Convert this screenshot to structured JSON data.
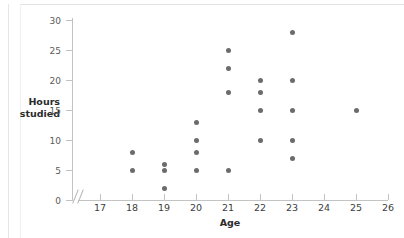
{
  "chart_data": {
    "type": "scatter",
    "title": "",
    "xlabel": "Age",
    "ylabel": "Hours studied",
    "xlim": [
      17,
      26
    ],
    "ylim": [
      0,
      30
    ],
    "xticks": [
      17,
      18,
      19,
      20,
      21,
      22,
      23,
      24,
      25,
      26
    ],
    "yticks": [
      0,
      5,
      10,
      15,
      20,
      25,
      30
    ],
    "grid": false,
    "legend": null,
    "axis_break_x": true,
    "marker_color": "#6b6b6b",
    "axis_color": "#c3c3c3",
    "points": [
      {
        "x": 18,
        "y": 8
      },
      {
        "x": 18,
        "y": 5
      },
      {
        "x": 19,
        "y": 6
      },
      {
        "x": 19,
        "y": 5
      },
      {
        "x": 19,
        "y": 2
      },
      {
        "x": 20,
        "y": 13
      },
      {
        "x": 20,
        "y": 10
      },
      {
        "x": 20,
        "y": 8
      },
      {
        "x": 20,
        "y": 5
      },
      {
        "x": 21,
        "y": 25
      },
      {
        "x": 21,
        "y": 22
      },
      {
        "x": 21,
        "y": 18
      },
      {
        "x": 21,
        "y": 5
      },
      {
        "x": 22,
        "y": 20
      },
      {
        "x": 22,
        "y": 18
      },
      {
        "x": 22,
        "y": 15
      },
      {
        "x": 22,
        "y": 10
      },
      {
        "x": 23,
        "y": 28
      },
      {
        "x": 23,
        "y": 20
      },
      {
        "x": 23,
        "y": 15
      },
      {
        "x": 23,
        "y": 10
      },
      {
        "x": 23,
        "y": 7
      },
      {
        "x": 25,
        "y": 15
      }
    ]
  },
  "axes": {
    "y_title_line1": "Hours",
    "y_title_line2": "studied",
    "x_title": "Age"
  }
}
